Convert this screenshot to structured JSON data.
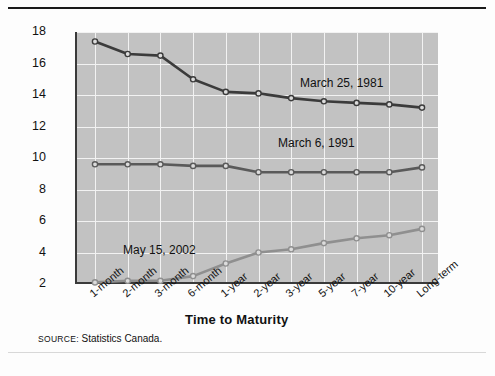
{
  "figure": {
    "source_prefix": "SOURCE:",
    "source_text": " Statistics Canada."
  },
  "chart_data": {
    "type": "line",
    "title": "",
    "xlabel": "Time to Maturity",
    "ylabel": "Yield to Maturity (%)",
    "categories": [
      "1-month",
      "2-month",
      "3-month",
      "6-month",
      "1-year",
      "2-year",
      "3-year",
      "5-year",
      "7-year",
      "10-year",
      "Long-term"
    ],
    "yticks": [
      2,
      4,
      6,
      8,
      10,
      12,
      14,
      16,
      18
    ],
    "ylim": [
      2,
      18
    ],
    "grid": true,
    "legend_position": "inline-annotations",
    "series": [
      {
        "name": "March 25, 1981",
        "color": "#3b3b3b",
        "values": [
          17.4,
          16.6,
          16.5,
          15.0,
          14.2,
          14.1,
          13.8,
          13.6,
          13.5,
          13.4,
          13.2
        ],
        "label_x": 300,
        "label_y": 76
      },
      {
        "name": "March 6, 1991",
        "color": "#5a5a5a",
        "values": [
          9.6,
          9.6,
          9.6,
          9.5,
          9.5,
          9.1,
          9.1,
          9.1,
          9.1,
          9.1,
          9.4
        ],
        "label_x": 278,
        "label_y": 136
      },
      {
        "name": "May 15, 2002",
        "color": "#8f8f8f",
        "values": [
          2.1,
          2.2,
          2.2,
          2.5,
          3.3,
          4.0,
          4.2,
          4.6,
          4.9,
          5.1,
          5.5
        ],
        "label_x": 123,
        "label_y": 243
      }
    ]
  }
}
